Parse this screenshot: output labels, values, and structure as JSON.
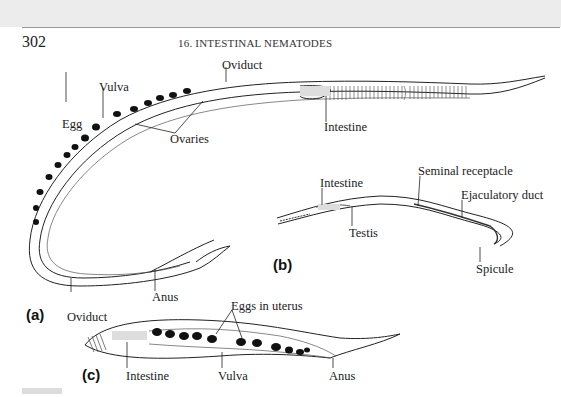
{
  "header": {
    "page_number": "302",
    "running_head": "16. INTESTINAL NEMATODES"
  },
  "figure": {
    "panels": [
      {
        "id": "a",
        "panel_label": "(a)",
        "description": "Adult female nematode, curved",
        "labels": [
          "Oviduct",
          "Vulva",
          "Egg",
          "Ovaries",
          "Intestine",
          "Anus",
          "Oviduct"
        ]
      },
      {
        "id": "b",
        "panel_label": "(b)",
        "description": "Adult male nematode",
        "labels": [
          "Intestine",
          "Seminal receptacle",
          "Ejaculatory duct",
          "Testis",
          "Spicule"
        ]
      },
      {
        "id": "c",
        "panel_label": "(c)",
        "description": "Female nematode with eggs in uterus",
        "labels": [
          "Eggs in uterus",
          "Intestine",
          "Vulva",
          "Anus"
        ]
      }
    ],
    "a": {
      "oviduct_top": "Oviduct",
      "vulva": "Vulva",
      "egg": "Egg",
      "ovaries": "Ovaries",
      "intestine": "Intestine",
      "anus": "Anus",
      "oviduct_bottom": "Oviduct",
      "panel_label": "(a)"
    },
    "b": {
      "intestine": "Intestine",
      "seminal_receptacle": "Seminal receptacle",
      "ejaculatory_duct": "Ejaculatory duct",
      "testis": "Testis",
      "spicule": "Spicule",
      "panel_label": "(b)"
    },
    "c": {
      "eggs_in_uterus": "Eggs in uterus",
      "intestine": "Intestine",
      "vulva": "Vulva",
      "anus": "Anus",
      "panel_label": "(c)"
    }
  }
}
